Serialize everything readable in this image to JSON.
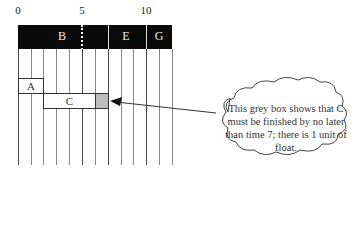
{
  "axis": {
    "ticks": [
      {
        "label": "0",
        "value": 0
      },
      {
        "label": "5",
        "value": 5
      },
      {
        "label": "10",
        "value": 10
      }
    ],
    "range": [
      0,
      12
    ]
  },
  "critical_band": {
    "activities": [
      {
        "label": "B",
        "start": 0,
        "end": 7
      },
      {
        "label": "E",
        "start": 7,
        "end": 10
      },
      {
        "label": "G",
        "start": 10,
        "end": 12
      }
    ],
    "color": "#0a0a0a"
  },
  "activities": [
    {
      "label": "A",
      "start": 0,
      "end": 2
    },
    {
      "label": "C",
      "start": 2,
      "end": 6,
      "float_end": 7
    }
  ],
  "float_color": "#bdbdbd",
  "callout": {
    "text": "This grey box shows that C must be finished by no later than time 7; there is 1 unit of float."
  }
}
